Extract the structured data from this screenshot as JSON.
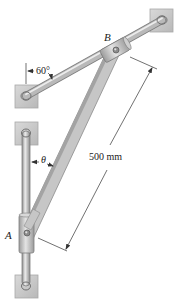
{
  "figure": {
    "type": "mechanism-diagram",
    "labels": {
      "collar_b": "B",
      "collar_a": "A",
      "fixed_angle": "60°",
      "variable_angle": "θ",
      "dimension": "500 mm"
    },
    "components": [
      {
        "name": "inclined-rod",
        "description": "rod fixed between upper-right and left supports, 60° from vertical"
      },
      {
        "name": "vertical-rod",
        "description": "vertical rod between two fixed supports"
      },
      {
        "name": "collar-b",
        "description": "collar sliding on inclined rod"
      },
      {
        "name": "collar-a",
        "description": "collar sliding on vertical rod"
      },
      {
        "name": "link-ab",
        "description": "bar AB pinned at both collars, length 500 mm, angle θ from vertical"
      }
    ],
    "colors": {
      "support": "#c8c8c8",
      "support_edge": "#a9a9a9",
      "rod": "#b5b5b5",
      "rod_highlight": "#e6e6e6",
      "link": "#c4c4c4",
      "line": "#333333",
      "background": "#ffffff"
    }
  }
}
